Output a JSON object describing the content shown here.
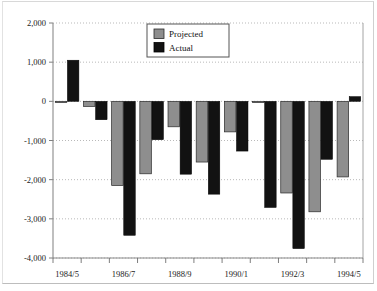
{
  "chart_data": {
    "type": "bar",
    "title": "",
    "subtitle": "",
    "xlabel": "",
    "ylabel": "",
    "ylim": [
      -4000,
      2000
    ],
    "ytick_values": [
      2000,
      1000,
      0,
      -1000,
      -2000,
      -3000,
      -4000
    ],
    "ytick_labels": [
      "2,000",
      "1,000",
      "0",
      "-1,000",
      "-2,000",
      "-3,000",
      "-4,000"
    ],
    "grid": true,
    "grid_axis": "y",
    "legend_position": "top-center",
    "categories": [
      "1984/5",
      "1985/6",
      "1986/7",
      "1987/8",
      "1988/9",
      "1989/90",
      "1990/1",
      "1991/2",
      "1992/3",
      "1993/4",
      "1994/5"
    ],
    "xtick_labels_shown": [
      "1984/5",
      "1986/7",
      "1988/9",
      "1990/1",
      "1992/3",
      "1994/5"
    ],
    "series": [
      {
        "name": "Projected",
        "color": "#8e8e8e",
        "values": [
          -20,
          -130,
          -2150,
          -1850,
          -650,
          -1550,
          -780,
          -30,
          -2340,
          -2820,
          -1930
        ]
      },
      {
        "name": "Actual",
        "color": "#121212",
        "values": [
          1050,
          -470,
          -3420,
          -980,
          -1860,
          -2370,
          -1270,
          -2710,
          -3760,
          -1480,
          120
        ]
      }
    ]
  },
  "legend": {
    "entries": [
      {
        "label": "Projected",
        "swatch": "gray-square-icon"
      },
      {
        "label": "Actual",
        "swatch": "black-square-icon"
      }
    ]
  }
}
